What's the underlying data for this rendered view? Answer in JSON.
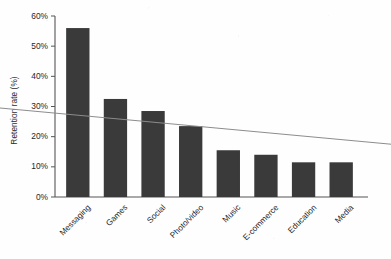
{
  "chart_data": {
    "type": "bar",
    "title": "",
    "subtitle": "",
    "xlabel": "",
    "ylabel": "Retention rate (%)",
    "categories": [
      "Messaging",
      "Games",
      "Social",
      "Photo/video",
      "Music",
      "E-commerce",
      "Education",
      "Media"
    ],
    "values": [
      56,
      32.5,
      28.5,
      23.5,
      15.5,
      14,
      11.5,
      11.5
    ],
    "ylim": [
      0,
      60
    ],
    "yticks": [
      0,
      10,
      20,
      30,
      40,
      50,
      60
    ],
    "ytick_labels": [
      "0%",
      "10%",
      "20%",
      "30%",
      "40%",
      "50%",
      "60%"
    ],
    "grid": false,
    "legend": null,
    "legend_position": "none",
    "series": [
      {
        "name": "Retention rate",
        "values": [
          56,
          32.5,
          28.5,
          23.5,
          15.5,
          14,
          11.5,
          11.5
        ]
      }
    ],
    "annotations": [
      {
        "type": "trendline",
        "name": "linear-trendline",
        "start_value": 29.5,
        "end_value": 17.5,
        "color": "#8c8c8c"
      }
    ],
    "colors": {
      "bar": "#3a3a3a",
      "axis": "#555555",
      "trendline": "#8c8c8c",
      "text": "#1e1e1e",
      "background": "#fefefe"
    }
  }
}
